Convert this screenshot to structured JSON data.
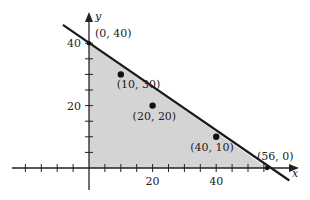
{
  "chart_data": {
    "type": "scatter",
    "title": "",
    "xlabel": "x",
    "ylabel": "y",
    "xlim": [
      -20,
      66
    ],
    "ylim": [
      -7,
      50
    ],
    "grid": false,
    "legend": null,
    "x_ticks": {
      "step": 5,
      "from": -20,
      "to": 55,
      "labels": [
        {
          "value": 20,
          "text": "20"
        },
        {
          "value": 40,
          "text": "40"
        }
      ]
    },
    "y_ticks": {
      "step": 5,
      "from": 5,
      "to": 40,
      "labels": [
        {
          "value": 20,
          "text": "20"
        },
        {
          "value": 40,
          "text": "40"
        }
      ]
    },
    "boundary_line": {
      "description": "line through (0, 40) and (56, 0)",
      "from": [
        -8.2,
        45.9
      ],
      "to": [
        63,
        -4
      ]
    },
    "shaded_region": {
      "description": "feasible region x>=0, y>=0, below line",
      "vertices": [
        [
          0,
          0
        ],
        [
          0,
          40
        ],
        [
          56,
          0
        ]
      ],
      "color": "#d4d4d4"
    },
    "points": [
      {
        "x": 0,
        "y": 40,
        "label": "(0, 40)",
        "marker": false,
        "label_dx": 6,
        "label_dy": -6
      },
      {
        "x": 10,
        "y": 30,
        "label": "(10, 30)",
        "marker": true,
        "label_dx": -4,
        "label_dy": 14
      },
      {
        "x": 20,
        "y": 20,
        "label": "(20, 20)",
        "marker": true,
        "label_dx": -20,
        "label_dy": 14
      },
      {
        "x": 40,
        "y": 10,
        "label": "(40, 10)",
        "marker": true,
        "label_dx": -26,
        "label_dy": 14
      },
      {
        "x": 56,
        "y": 0,
        "label": "(56, 0)",
        "marker": false,
        "label_dx": -10,
        "label_dy": -8
      }
    ]
  },
  "colors": {
    "axis": "#222222",
    "line": "#1a1a1a",
    "fill": "#d4d4d4",
    "point": "#111111"
  }
}
